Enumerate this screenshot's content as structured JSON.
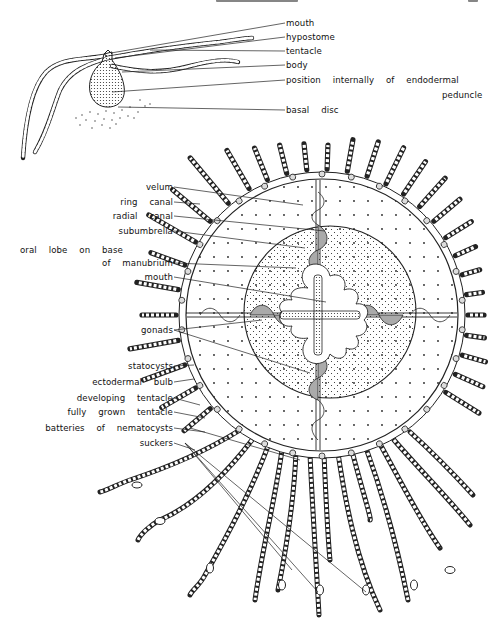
{
  "figure": {
    "upper_drawing": "hydroid polyp stage (side view)",
    "lower_drawing": "medusa (oral view)",
    "ink_color": "#111111",
    "paper_color": "#ffffff"
  },
  "polyp_labels": [
    {
      "id": "mouth",
      "text": "mouth"
    },
    {
      "id": "hypostome",
      "text": "hypostome"
    },
    {
      "id": "tentacle",
      "text": "tentacle"
    },
    {
      "id": "body",
      "text": "body"
    },
    {
      "id": "peduncle_1",
      "text": "position   internally   of   endodermal"
    },
    {
      "id": "peduncle_2",
      "text": "peduncle"
    },
    {
      "id": "basal_disc",
      "text": "basal   disc"
    }
  ],
  "medusa_labels": [
    {
      "id": "velum",
      "text": "velum"
    },
    {
      "id": "ring_canal",
      "text": "ring   canal"
    },
    {
      "id": "radial_canal",
      "text": "radial   canal"
    },
    {
      "id": "subumbrella",
      "text": "subumbrella"
    },
    {
      "id": "oral_lobe_1",
      "text": "oral   lobe   on   base"
    },
    {
      "id": "oral_lobe_2",
      "text": "of   manubrium"
    },
    {
      "id": "mouth",
      "text": "mouth"
    },
    {
      "id": "gonads",
      "text": "gonads"
    },
    {
      "id": "statocysts",
      "text": "statocysts"
    },
    {
      "id": "ectodermal_bulb",
      "text": "ectodermal   bulb"
    },
    {
      "id": "developing_tentacle",
      "text": "developing   tentacle"
    },
    {
      "id": "fully_grown_tentacle",
      "text": "fully   grown   tentacle"
    },
    {
      "id": "batteries",
      "text": "batteries   of   nematocysts"
    },
    {
      "id": "suckers",
      "text": "suckers"
    }
  ]
}
